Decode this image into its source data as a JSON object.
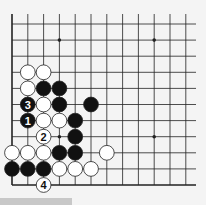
{
  "diagram": {
    "type": "go-board-fragment",
    "colors": {
      "background": "#f4f4f4",
      "line": "#222222",
      "black": "#111111",
      "white": "#ffffff"
    },
    "grid": {
      "x0": 12,
      "dx": 15.8,
      "y0": 24,
      "dy": 16.1,
      "cols": 12,
      "rows": 11
    },
    "star_points": [
      {
        "c": 3,
        "r": 1
      },
      {
        "c": 9,
        "r": 1
      },
      {
        "c": 3,
        "r": 7
      },
      {
        "c": 9,
        "r": 7
      }
    ],
    "stones": [
      {
        "c": 1,
        "r": 3,
        "color": "white"
      },
      {
        "c": 2,
        "r": 3,
        "color": "white"
      },
      {
        "c": 1,
        "r": 4,
        "color": "white"
      },
      {
        "c": 2,
        "r": 4,
        "color": "black"
      },
      {
        "c": 3,
        "r": 4,
        "color": "black"
      },
      {
        "c": 1,
        "r": 5,
        "color": "black",
        "label": "3"
      },
      {
        "c": 2,
        "r": 5,
        "color": "white"
      },
      {
        "c": 3,
        "r": 5,
        "color": "black"
      },
      {
        "c": 5,
        "r": 5,
        "color": "black"
      },
      {
        "c": 1,
        "r": 6,
        "color": "black",
        "label": "1"
      },
      {
        "c": 2,
        "r": 6,
        "color": "white"
      },
      {
        "c": 3,
        "r": 6,
        "color": "white"
      },
      {
        "c": 4,
        "r": 6,
        "color": "black"
      },
      {
        "c": 2,
        "r": 7,
        "color": "white",
        "label": "2"
      },
      {
        "c": 4,
        "r": 7,
        "color": "black"
      },
      {
        "c": 0,
        "r": 8,
        "color": "white"
      },
      {
        "c": 1,
        "r": 8,
        "color": "white"
      },
      {
        "c": 2,
        "r": 8,
        "color": "white"
      },
      {
        "c": 3,
        "r": 8,
        "color": "black"
      },
      {
        "c": 4,
        "r": 8,
        "color": "black"
      },
      {
        "c": 6,
        "r": 8,
        "color": "white"
      },
      {
        "c": 0,
        "r": 9,
        "color": "black"
      },
      {
        "c": 1,
        "r": 9,
        "color": "black"
      },
      {
        "c": 2,
        "r": 9,
        "color": "black"
      },
      {
        "c": 3,
        "r": 9,
        "color": "white"
      },
      {
        "c": 4,
        "r": 9,
        "color": "white"
      },
      {
        "c": 5,
        "r": 9,
        "color": "white"
      },
      {
        "c": 2,
        "r": 10,
        "color": "white",
        "label": "4"
      }
    ]
  }
}
